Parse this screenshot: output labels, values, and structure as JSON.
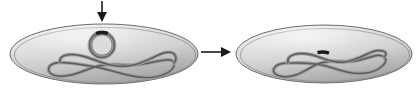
{
  "figure": {
    "title": "Plasmid uptake and integration into the bacterial chromosome",
    "caption": "",
    "width": 417,
    "height": 92,
    "background_color": "#ffffff"
  },
  "colors": {
    "cell_fill_light": "#e2e2e2",
    "cell_fill_mid": "#cdcdcd",
    "cell_fill_dark": "#a9a9a9",
    "cell_outline": "#6e6e6e",
    "cell_inner_outline": "#8c8c8c",
    "dna_strand": "#5a5a5a",
    "dna_strand_light": "#9a9a9a",
    "gene_marker": "#1c1c1c",
    "arrow": "#1a1a1a"
  },
  "arrows": [
    {
      "name": "incoming-dna-arrow",
      "direction": "down",
      "label": "",
      "x1": 102,
      "y1": 1,
      "x2": 102,
      "y2": 17
    },
    {
      "name": "transformation-step-arrow",
      "direction": "right",
      "label": "",
      "x1": 201,
      "y1": 52,
      "x2": 226,
      "y2": 52
    }
  ],
  "panels": [
    {
      "name": "cell-before",
      "label": "Cell with free plasmid",
      "ellipse": {
        "cx": 104,
        "cy": 54,
        "rx": 94,
        "ry": 30
      },
      "elements": [
        {
          "name": "bacterial-chromosome",
          "label": "Bacterial chromosome",
          "type": "supercoiled-loop"
        },
        {
          "name": "plasmid-ring",
          "label": "Plasmid",
          "type": "circle",
          "cx": 102,
          "cy": 45,
          "r": 13
        },
        {
          "name": "gene-marker-on-plasmid",
          "label": "Gene of interest",
          "type": "segment",
          "cx": 102,
          "cy": 33
        }
      ]
    },
    {
      "name": "cell-after",
      "label": "Cell with plasmid gene integrated",
      "ellipse": {
        "cx": 324,
        "cy": 54,
        "rx": 88,
        "ry": 29
      },
      "elements": [
        {
          "name": "bacterial-chromosome",
          "label": "Bacterial chromosome with inserted gene",
          "type": "supercoiled-loop"
        },
        {
          "name": "gene-marker-on-chromosome",
          "label": "Integrated gene of interest",
          "type": "segment",
          "cx": 323,
          "cy": 51
        }
      ]
    }
  ],
  "accessibility": {
    "figure_description": "Left: an oval bacterial cell containing a large supercoiled chromosome loop and a small separate circular plasmid bearing a dark gene segment, with a downward arrow above indicating plasmid entry. A rightward arrow leads to: Right: an oval bacterial cell in which the dark gene segment is now incorporated into the chromosome loop."
  }
}
